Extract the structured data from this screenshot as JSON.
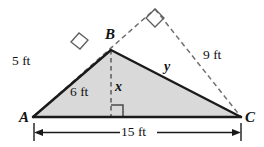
{
  "figure": {
    "type": "geometry-diagram",
    "shape": "triangle",
    "fill_color": "#d9d9d9",
    "solid_stroke_color": "#1a1a1a",
    "dashed_stroke_color": "#6f6f6f",
    "vertices": [
      {
        "name": "A",
        "label": "A",
        "x": 33,
        "y": 117
      },
      {
        "name": "B",
        "label": "B",
        "x": 111,
        "y": 50
      },
      {
        "name": "C",
        "label": "C",
        "x": 241,
        "y": 117
      }
    ],
    "apex_dashed": {
      "x": 155,
      "y": 9
    },
    "altitude_foot": {
      "x": 111,
      "y": 117
    },
    "measurements": [
      {
        "name": "side-ab-outer",
        "label": "5 ft",
        "value": 5,
        "unit": "ft"
      },
      {
        "name": "side-ab",
        "label": "6 ft",
        "value": 6,
        "unit": "ft"
      },
      {
        "name": "altitude",
        "label": "x",
        "value": null,
        "unit": "ft"
      },
      {
        "name": "side-bc",
        "label": "y",
        "value": null,
        "unit": "ft"
      },
      {
        "name": "side-bc-outer",
        "label": "9 ft",
        "value": 9,
        "unit": "ft"
      },
      {
        "name": "base-ac",
        "label": "15 ft",
        "value": 15,
        "unit": "ft"
      }
    ],
    "right_angle_marks": [
      {
        "name": "right-angle-left",
        "at": "A-to-apex-dashed"
      },
      {
        "name": "right-angle-top",
        "at": "apex-dashed"
      },
      {
        "name": "right-angle-altitude",
        "at": "altitude-foot"
      }
    ]
  }
}
